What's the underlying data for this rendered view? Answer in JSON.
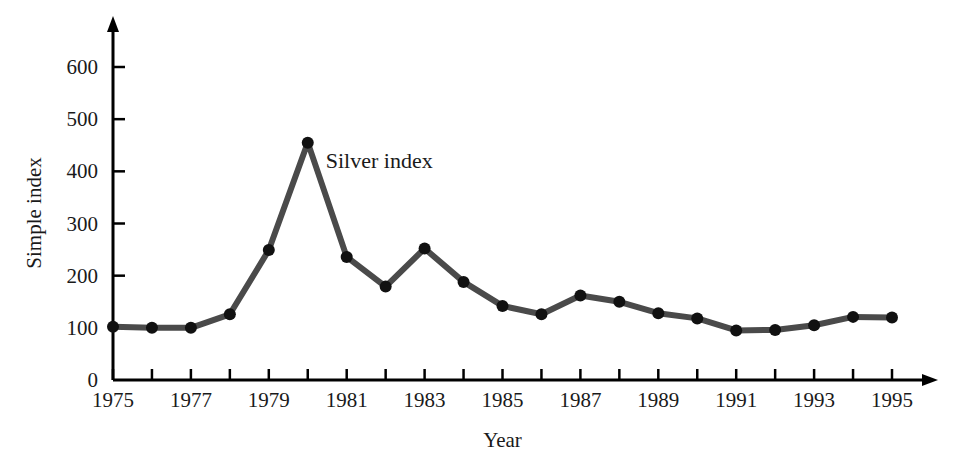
{
  "chart_data": {
    "type": "line",
    "title": "",
    "xlabel": "Year",
    "ylabel": "Simple index",
    "annotation": "Silver index",
    "series_name": "Silver index",
    "line_color": "#4a4a4a",
    "marker_color": "#111111",
    "axis_color": "#000000",
    "grid": false,
    "legend_position": "inline-annotation",
    "xlim": [
      1975,
      1995
    ],
    "ylim": [
      0,
      650
    ],
    "x_tick_values": [
      1975,
      1976,
      1977,
      1978,
      1979,
      1980,
      1981,
      1982,
      1983,
      1984,
      1985,
      1986,
      1987,
      1988,
      1989,
      1990,
      1991,
      1992,
      1993,
      1994,
      1995
    ],
    "x_tick_labels": [
      "1975",
      "",
      "1977",
      "",
      "1979",
      "",
      "1981",
      "",
      "1983",
      "",
      "1985",
      "",
      "1987",
      "",
      "1989",
      "",
      "1991",
      "",
      "1993",
      "",
      "1995"
    ],
    "y_tick_values": [
      0,
      100,
      200,
      300,
      400,
      500,
      600
    ],
    "y_tick_labels": [
      "0",
      "100",
      "200",
      "300",
      "400",
      "500",
      "600"
    ],
    "x": [
      1975,
      1976,
      1977,
      1978,
      1979,
      1980,
      1981,
      1982,
      1983,
      1984,
      1985,
      1986,
      1987,
      1988,
      1989,
      1990,
      1991,
      1992,
      1993,
      1994,
      1995
    ],
    "values": [
      102,
      100,
      100,
      126,
      249,
      455,
      236,
      179,
      252,
      188,
      142,
      126,
      162,
      150,
      128,
      118,
      95,
      96,
      105,
      121,
      120
    ]
  },
  "axes": {
    "y_title": "Simple index",
    "x_title": "Year"
  }
}
